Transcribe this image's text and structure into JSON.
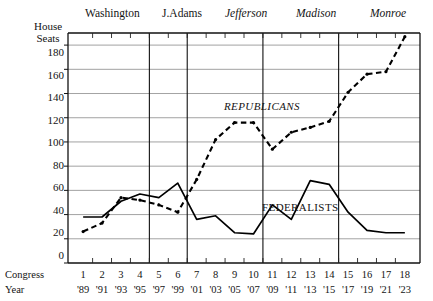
{
  "figure": {
    "y_axis_title_line1": "House",
    "y_axis_title_line2": "Seats",
    "congress_row_label": "Congress",
    "year_row_label": "Year",
    "republicans_label": "REPUBLICANS",
    "federalists_label": "FEDERALISTS"
  },
  "presidents": [
    {
      "name": "Washington",
      "style": "roman",
      "start_congress": 1,
      "end_congress": 4
    },
    {
      "name": "J.Adams",
      "style": "roman",
      "start_congress": 5,
      "end_congress": 6
    },
    {
      "name": "Jefferson",
      "style": "italic",
      "start_congress": 7,
      "end_congress": 10
    },
    {
      "name": "Madison",
      "style": "italic",
      "start_congress": 11,
      "end_congress": 14
    },
    {
      "name": "Monroe",
      "style": "italic",
      "start_congress": 15,
      "end_congress": 18
    }
  ],
  "chart_data": {
    "type": "line",
    "title": "",
    "xlabel": "Congress / Year",
    "ylabel": "House Seats",
    "ylim": [
      0,
      190
    ],
    "yticks": [
      0,
      20,
      40,
      60,
      80,
      100,
      120,
      140,
      160,
      180
    ],
    "grid": true,
    "legend": "inline-annotations",
    "categories": [
      1,
      2,
      3,
      4,
      5,
      6,
      7,
      8,
      9,
      10,
      11,
      12,
      13,
      14,
      15,
      16,
      17,
      18
    ],
    "x_congress": [
      "1",
      "2",
      "3",
      "4",
      "5",
      "6",
      "7",
      "8",
      "9",
      "10",
      "11",
      "12",
      "13",
      "14",
      "15",
      "16",
      "17",
      "18"
    ],
    "x_years": [
      "'89",
      "'91",
      "'93",
      "'95",
      "'97",
      "'99",
      "'01",
      "'03",
      "'05",
      "'07",
      "'09",
      "'11",
      "'13",
      "'15",
      "'17",
      "'19",
      "'21",
      "'23"
    ],
    "series": [
      {
        "name": "FEDERALISTS",
        "style": "solid",
        "values": [
          38,
          38,
          51,
          57,
          54,
          66,
          36,
          39,
          25,
          24,
          48,
          36,
          68,
          65,
          42,
          27,
          25,
          25
        ]
      },
      {
        "name": "REPUBLICANS",
        "style": "dashed",
        "values": [
          26,
          33,
          54,
          52,
          48,
          42,
          69,
          102,
          116,
          116,
          94,
          108,
          112,
          117,
          141,
          156,
          158,
          187
        ]
      }
    ]
  }
}
